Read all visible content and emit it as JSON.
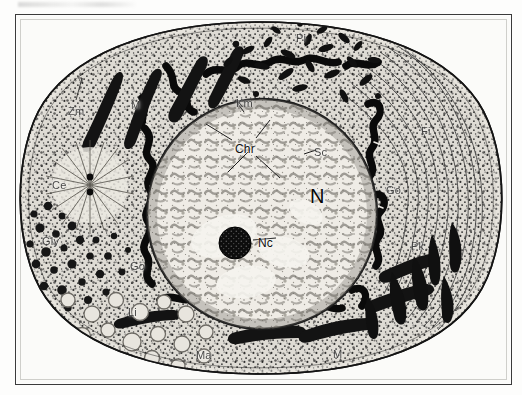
{
  "figure": {
    "kind": "cell-ultrastructure-diagram",
    "frame_color": "#3b3b3b",
    "paper_color": "#fbfbf9",
    "ink_color": "#111111"
  },
  "labels": [
    {
      "id": "zm",
      "text": "Zm",
      "x": 68,
      "y": 106,
      "size": "sm",
      "meaning": "Zellmembran"
    },
    {
      "id": "m1",
      "text": "M",
      "x": 131,
      "y": 100,
      "size": "sm",
      "meaning": "Mitochondrium"
    },
    {
      "id": "ce",
      "text": "Ce",
      "x": 52,
      "y": 180,
      "size": "sm",
      "meaning": "Centriol"
    },
    {
      "id": "gly",
      "text": "Gly",
      "x": 42,
      "y": 236,
      "size": "sm",
      "meaning": "Glykogen"
    },
    {
      "id": "go2",
      "text": "Go",
      "x": 130,
      "y": 261,
      "size": "sm",
      "meaning": "Golgi-Apparat"
    },
    {
      "id": "li",
      "text": "Li",
      "x": 128,
      "y": 307,
      "size": "sm",
      "meaning": "Lipidtropfen"
    },
    {
      "id": "ma",
      "text": "Ma",
      "x": 196,
      "y": 350,
      "size": "sm",
      "meaning": "Matrix"
    },
    {
      "id": "m2",
      "text": "M",
      "x": 333,
      "y": 349,
      "size": "sm",
      "meaning": "Mitochondrium"
    },
    {
      "id": "pi",
      "text": "Pi",
      "x": 296,
      "y": 33,
      "size": "sm",
      "meaning": "Plasmaeinschluss"
    },
    {
      "id": "km",
      "text": "Km",
      "x": 236,
      "y": 98,
      "size": "sm",
      "meaning": "Kernmembran"
    },
    {
      "id": "chr",
      "text": "Chr",
      "x": 235,
      "y": 143,
      "size": "norm",
      "meaning": "Chromatin"
    },
    {
      "id": "sc",
      "text": "Sc",
      "x": 314,
      "y": 147,
      "size": "sm",
      "meaning": "Saftraum"
    },
    {
      "id": "n",
      "text": "N",
      "x": 310,
      "y": 186,
      "size": "big",
      "meaning": "Nucleus"
    },
    {
      "id": "nc",
      "text": "Nc",
      "x": 258,
      "y": 237,
      "size": "norm",
      "meaning": "Nucleolus"
    },
    {
      "id": "fi",
      "text": "Fi",
      "x": 421,
      "y": 126,
      "size": "sm",
      "meaning": "Fibrillen"
    },
    {
      "id": "go1",
      "text": "Go",
      "x": 386,
      "y": 185,
      "size": "sm",
      "meaning": "Golgi-Apparat"
    },
    {
      "id": "pk",
      "text": "Pk",
      "x": 411,
      "y": 241,
      "size": "sm",
      "meaning": "Plasmakoerner"
    }
  ]
}
